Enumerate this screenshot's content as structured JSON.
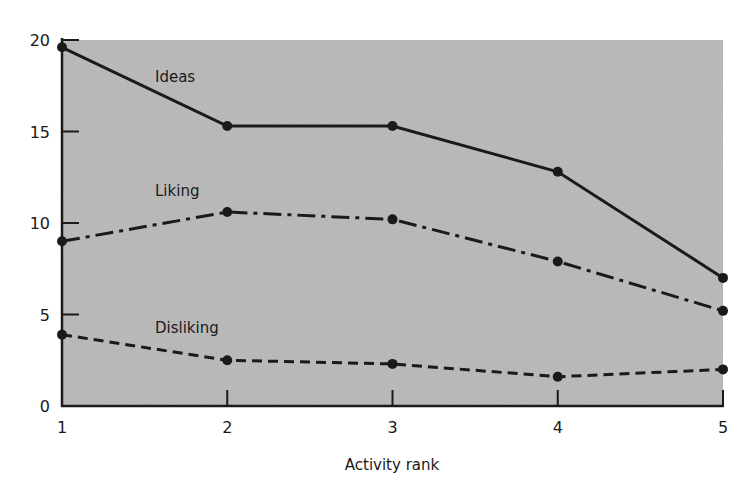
{
  "chart_data": {
    "type": "line",
    "title": "",
    "xlabel": "Activity rank",
    "ylabel": "",
    "x": [
      1,
      2,
      3,
      4,
      5
    ],
    "xlim": [
      1,
      5
    ],
    "ylim": [
      0,
      20
    ],
    "yticks": [
      0,
      5,
      10,
      15,
      20
    ],
    "xticks": [
      1,
      2,
      3,
      4,
      5
    ],
    "grid": false,
    "legend": "inline labels",
    "series": [
      {
        "name": "Ideas",
        "style": "solid",
        "values": [
          19.6,
          15.3,
          15.3,
          12.8,
          7.0
        ]
      },
      {
        "name": "Liking",
        "style": "dash-dot",
        "values": [
          9.0,
          10.6,
          10.2,
          7.9,
          5.2
        ]
      },
      {
        "name": "Disliking",
        "style": "dashed",
        "values": [
          3.9,
          2.5,
          2.3,
          1.6,
          2.0
        ]
      }
    ],
    "colors": {
      "plot_background": "#b8b8b8",
      "line": "#1a1a1a"
    }
  }
}
